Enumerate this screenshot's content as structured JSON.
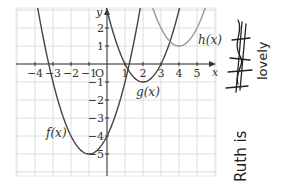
{
  "chart_data": {
    "type": "line",
    "title": "",
    "xlabel": "x",
    "ylabel": "y",
    "origin_label": "O",
    "xlim": [
      -5,
      6
    ],
    "ylim": [
      -6,
      3
    ],
    "grid": true,
    "x_ticks": [
      -4,
      -3,
      -2,
      -1,
      1,
      2,
      3,
      4,
      5
    ],
    "y_ticks": [
      2,
      1,
      -1,
      -2,
      -3,
      -4,
      -5
    ],
    "series": [
      {
        "name": "f(x)",
        "label": "f(x)",
        "formula": "(x+1)^2-5",
        "vertex": [
          -1,
          -5
        ],
        "color": "#444444",
        "points": [
          [
            -4,
            4
          ],
          [
            -3,
            -1
          ],
          [
            -2,
            -4
          ],
          [
            -1,
            -5
          ],
          [
            0,
            -4
          ],
          [
            1,
            -1
          ],
          [
            2,
            4
          ]
        ]
      },
      {
        "name": "g(x)",
        "label": "g(x)",
        "formula": "(x-2)^2-1",
        "vertex": [
          2,
          -1
        ],
        "color": "#444444",
        "points": [
          [
            0,
            3
          ],
          [
            1,
            0
          ],
          [
            2,
            -1
          ],
          [
            3,
            0
          ],
          [
            4,
            3
          ]
        ]
      },
      {
        "name": "h(x)",
        "label": "h(x)",
        "formula": "(x-4)^2+1",
        "vertex": [
          4,
          1
        ],
        "color": "#999999",
        "points": [
          [
            2,
            5
          ],
          [
            3,
            2
          ],
          [
            4,
            1
          ],
          [
            5,
            2
          ],
          [
            6,
            5
          ]
        ]
      }
    ]
  },
  "annotations": {
    "handwriting_main": "Ruth is",
    "handwriting_crossed": "hateful",
    "handwriting_side": "lovely"
  }
}
